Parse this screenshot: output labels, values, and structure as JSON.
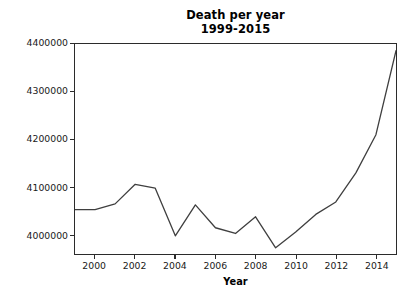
{
  "figure": {
    "width": 415,
    "height": 307,
    "background": "#ffffff",
    "line_color": "#3f3f3f",
    "axis_color": "#2b2b2b",
    "text_color": "#1a1a1a"
  },
  "chart_data": {
    "type": "line",
    "title": "Death per year",
    "subtitle": "1999-2015",
    "xlabel": "Year",
    "ylabel": "",
    "x": [
      1999,
      2000,
      2001,
      2002,
      2003,
      2004,
      2005,
      2006,
      2007,
      2008,
      2009,
      2010,
      2011,
      2012,
      2013,
      2014,
      2015
    ],
    "values": [
      4053000,
      4053000,
      4065000,
      4106000,
      4098000,
      3998000,
      4063000,
      4015000,
      4003000,
      4038000,
      3973000,
      4006000,
      4043000,
      4069000,
      4130000,
      4210000,
      4386000
    ],
    "series": [
      {
        "name": "Deaths",
        "values": [
          4053000,
          4053000,
          4065000,
          4106000,
          4098000,
          3998000,
          4063000,
          4015000,
          4003000,
          4038000,
          3973000,
          4006000,
          4043000,
          4069000,
          4130000,
          4210000,
          4386000
        ]
      }
    ],
    "xlim": [
      1999,
      2015
    ],
    "ylim": [
      3960000,
      4400000
    ],
    "grid": false,
    "legend": false,
    "marker": "none",
    "linewidth": 1.3,
    "xticks": [
      2000,
      2002,
      2004,
      2006,
      2008,
      2010,
      2012,
      2014
    ],
    "xtick_labels": [
      "2000",
      "2002",
      "2004",
      "2006",
      "2008",
      "2010",
      "2012",
      "2014"
    ],
    "yticks": [
      4000000,
      4100000,
      4200000,
      4300000,
      4400000
    ],
    "ytick_labels": [
      "4000000",
      "4100000",
      "4200000",
      "4300000",
      "4400000"
    ]
  }
}
